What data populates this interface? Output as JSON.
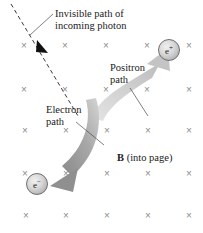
{
  "figure": {
    "background_color": "#ffffff",
    "width": 203,
    "height": 233
  },
  "labels": {
    "photon_path": "Invisible path of\nincoming photon",
    "positron_path": "Positron\npath",
    "electron_path": "Electron\npath",
    "field_symbol": "B",
    "field_direction": " (into page)"
  },
  "particles": [
    {
      "name": "positron",
      "symbol": "e",
      "charge": "+",
      "x": 169,
      "y": 50
    },
    {
      "name": "electron",
      "symbol": "e",
      "charge": "−",
      "x": 37,
      "y": 184
    }
  ],
  "field": {
    "symbol": "×",
    "direction": "into-page",
    "color": "#8c8c8c",
    "rows": 5,
    "columns": 5,
    "marks": [
      {
        "x": 24,
        "y": 46
      },
      {
        "x": 65,
        "y": 46
      },
      {
        "x": 106,
        "y": 46
      },
      {
        "x": 147,
        "y": 46
      },
      {
        "x": 189,
        "y": 46
      },
      {
        "x": 24,
        "y": 90
      },
      {
        "x": 65,
        "y": 90
      },
      {
        "x": 106,
        "y": 90
      },
      {
        "x": 147,
        "y": 90
      },
      {
        "x": 189,
        "y": 90
      },
      {
        "x": 25,
        "y": 131
      },
      {
        "x": 66,
        "y": 131
      },
      {
        "x": 107,
        "y": 131
      },
      {
        "x": 148,
        "y": 131
      },
      {
        "x": 189,
        "y": 131
      },
      {
        "x": 25,
        "y": 174
      },
      {
        "x": 66,
        "y": 174
      },
      {
        "x": 107,
        "y": 174
      },
      {
        "x": 148,
        "y": 174
      },
      {
        "x": 189,
        "y": 174
      },
      {
        "x": 26,
        "y": 216
      },
      {
        "x": 66,
        "y": 216
      },
      {
        "x": 107,
        "y": 216
      },
      {
        "x": 148,
        "y": 216
      },
      {
        "x": 189,
        "y": 216
      }
    ]
  },
  "paths": {
    "photon": {
      "style": "dashed",
      "color": "#3a3a3a",
      "from_x": 11,
      "from_y": 4,
      "to_x": 78,
      "to_y": 116,
      "arrow_x": 43,
      "arrow_y": 48
    },
    "positron": {
      "style": "curved-arrow",
      "color": "#c9c9c9",
      "from_x": 96,
      "from_y": 112,
      "to_x": 166,
      "to_y": 64
    },
    "electron": {
      "style": "curved-arrow",
      "color": "#8f8f8f",
      "from_x": 99,
      "from_y": 100,
      "to_x": 52,
      "to_y": 186
    }
  },
  "leaders": [
    {
      "name": "photon-leader",
      "x1": 53,
      "y1": 14,
      "x2": 30,
      "y2": 34
    },
    {
      "name": "positron-leader",
      "x1": 131,
      "y1": 88,
      "x2": 147,
      "y2": 114
    },
    {
      "name": "electron-leader",
      "x1": 76,
      "y1": 122,
      "x2": 103,
      "y2": 144
    }
  ]
}
